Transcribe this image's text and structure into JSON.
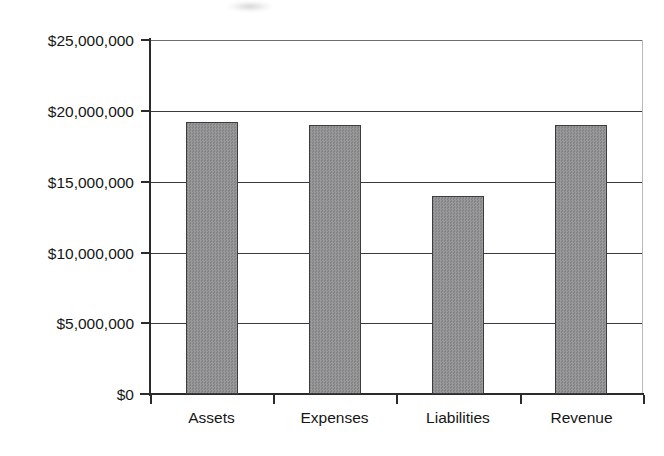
{
  "chart_data": {
    "type": "bar",
    "title": "",
    "xlabel": "",
    "ylabel": "",
    "categories": [
      "Assets",
      "Expenses",
      "Liabilities",
      "Revenue"
    ],
    "values": [
      19200000,
      19000000,
      14000000,
      19000000
    ],
    "ylim": [
      0,
      25000000
    ],
    "ytick_values": [
      0,
      5000000,
      10000000,
      15000000,
      20000000,
      25000000
    ],
    "ytick_labels": [
      "$0",
      "$5,000,000",
      "$10,000,000",
      "$15,000,000",
      "$20,000,000",
      "$25,000,000"
    ],
    "grid": true,
    "grid_axis": "y",
    "legend": false,
    "legend_position": "none",
    "series": [
      {
        "name": "",
        "values": [
          19200000,
          19000000,
          14000000,
          19000000
        ]
      }
    ],
    "bar_fill_color": "#8f8f90",
    "bar_edge_color": "#3c3c3e",
    "axis_color": "#2b2b2b",
    "grid_color": "#3a3a3c",
    "background_color": "#ffffff"
  },
  "axis": {
    "ylabels": [
      "$25,000,000",
      "$20,000,000",
      "$15,000,000",
      "$10,000,000",
      "$5,000,000",
      "$0"
    ],
    "xlabels": [
      "Assets",
      "Expenses",
      "Liabilities",
      "Revenue"
    ]
  }
}
